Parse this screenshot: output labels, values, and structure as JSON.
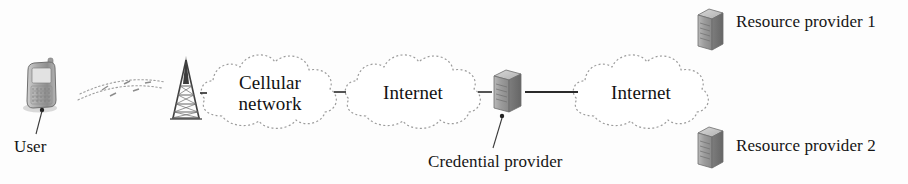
{
  "diagram": {
    "background_color": "#fdfdfd",
    "ink_color": "#1b1b1b",
    "cloud_outline_color": "#9a9a9a",
    "connector_color": "#2a2a2a"
  },
  "nodes": {
    "user_device": {
      "icon": "mobile-phone-icon",
      "label": "User",
      "x": 38,
      "y": 70
    },
    "cell_tower": {
      "icon": "cell-tower-icon",
      "label": "",
      "x": 185,
      "y": 92
    },
    "cellular_network": {
      "icon": "cloud-icon",
      "label_line_1": "Cellular",
      "label_line_2": "network",
      "x": 270,
      "y": 90
    },
    "internet_left": {
      "icon": "cloud-icon",
      "label": "Internet",
      "x": 412,
      "y": 92
    },
    "credential_provider": {
      "icon": "server-icon",
      "label": "Credential provider",
      "x": 506,
      "y": 90
    },
    "internet_right": {
      "icon": "cloud-icon",
      "label": "Internet",
      "x": 640,
      "y": 92
    },
    "resource_provider_1": {
      "icon": "server-icon",
      "label": "Resource provider 1",
      "x": 704,
      "y": 22
    },
    "resource_provider_2": {
      "icon": "server-icon",
      "label": "Resource provider 2",
      "x": 704,
      "y": 140
    }
  },
  "links": [
    {
      "name": "wireless-link",
      "from": "user_device",
      "to": "cell_tower",
      "style": "radio-waves"
    },
    {
      "name": "tower-to-cellular-link",
      "from": "cell_tower",
      "to": "cellular_network",
      "style": "solid"
    },
    {
      "name": "cellular-to-internet-link",
      "from": "cellular_network",
      "to": "internet_left",
      "style": "solid"
    },
    {
      "name": "internet-to-credential-link",
      "from": "internet_left",
      "to": "credential_provider",
      "style": "solid"
    },
    {
      "name": "credential-to-internet-link",
      "from": "credential_provider",
      "to": "internet_right",
      "style": "solid"
    }
  ],
  "callouts": [
    {
      "name": "user-callout",
      "label": "User",
      "target": "user_device"
    },
    {
      "name": "credential-provider-callout",
      "label": "Credential provider",
      "target": "credential_provider"
    }
  ]
}
